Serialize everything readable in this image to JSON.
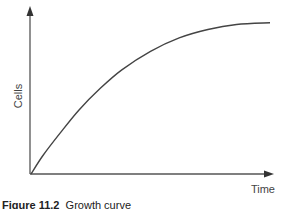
{
  "chart_data": {
    "type": "line",
    "title": "",
    "xlabel": "Time",
    "ylabel": "Cells",
    "xlim": [
      0,
      1
    ],
    "ylim": [
      0,
      1
    ],
    "grid": false,
    "legend": "none",
    "ticks": "none",
    "series": [
      {
        "name": "growth",
        "x": [
          0,
          0.05,
          0.12,
          0.2,
          0.29,
          0.38,
          0.5,
          0.62,
          0.74,
          0.86,
          1.0
        ],
        "y": [
          0,
          0.11,
          0.24,
          0.38,
          0.51,
          0.62,
          0.73,
          0.81,
          0.86,
          0.89,
          0.9
        ]
      }
    ]
  },
  "caption": {
    "figure_label": "Figure 11.2",
    "text": "Growth curve"
  }
}
